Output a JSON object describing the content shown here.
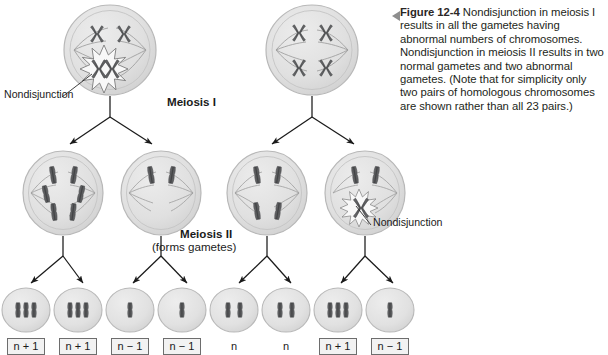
{
  "caption": {
    "marker": "left-triangle",
    "figure_number": "Figure 12-4",
    "text": " Nondisjunction in meiosis I results in all the gametes having abnormal numbers of chromosomes. Nondisjunction in meiosis II results in two normal gametes and two abnormal gametes. (Note that for simplicity only two pairs of homologous chromosomes are shown rather than all 23 pairs.)"
  },
  "labels": {
    "meiosis_1": "Meiosis I",
    "meiosis_2": "Meiosis II",
    "meiosis_2_sub": "(forms gametes)",
    "nondisjunction_1": "Nondisjunction",
    "nondisjunction_2": "Nondisjunction"
  },
  "rows": {
    "parent_cells": [
      {
        "name": "parent-cell-left",
        "cx": 110,
        "cy": 50,
        "chromosomes": 4,
        "nondisjunction": true,
        "note": "meiosis I nondisjunction - burst at lower chromosome pair"
      },
      {
        "name": "parent-cell-right",
        "cx": 312,
        "cy": 50,
        "chromosomes": 4,
        "nondisjunction": false
      }
    ],
    "meiosis1_products": [
      {
        "name": "m1-cell-1",
        "cx": 63,
        "cy": 193,
        "chromosomes": 6,
        "nondisjunction": false
      },
      {
        "name": "m1-cell-2",
        "cx": 161,
        "cy": 193,
        "chromosomes": 2,
        "nondisjunction": false
      },
      {
        "name": "m1-cell-3",
        "cx": 267,
        "cy": 193,
        "chromosomes": 4,
        "nondisjunction": false
      },
      {
        "name": "m1-cell-4",
        "cx": 365,
        "cy": 193,
        "chromosomes": 4,
        "nondisjunction": true,
        "note": "meiosis II nondisjunction - burst at lower chromosome"
      }
    ],
    "gametes": [
      {
        "name": "gamete-1",
        "cx": 26,
        "cy": 310,
        "chromosomes": 3,
        "ploidy": "n + 1",
        "boxed": true
      },
      {
        "name": "gamete-2",
        "cx": 78,
        "cy": 310,
        "chromosomes": 3,
        "ploidy": "n + 1",
        "boxed": true
      },
      {
        "name": "gamete-3",
        "cx": 130,
        "cy": 310,
        "chromosomes": 1,
        "ploidy": "n − 1",
        "boxed": true
      },
      {
        "name": "gamete-4",
        "cx": 182,
        "cy": 310,
        "chromosomes": 1,
        "ploidy": "n − 1",
        "boxed": true
      },
      {
        "name": "gamete-5",
        "cx": 234,
        "cy": 310,
        "chromosomes": 2,
        "ploidy": "n",
        "boxed": false
      },
      {
        "name": "gamete-6",
        "cx": 286,
        "cy": 310,
        "chromosomes": 2,
        "ploidy": "n",
        "boxed": false
      },
      {
        "name": "gamete-7",
        "cx": 338,
        "cy": 310,
        "chromosomes": 3,
        "ploidy": "n + 1",
        "boxed": true
      },
      {
        "name": "gamete-8",
        "cx": 390,
        "cy": 310,
        "chromosomes": 1,
        "ploidy": "n − 1",
        "boxed": true
      }
    ]
  },
  "colors": {
    "cell_fill": "#dedede",
    "cell_fill_light": "#e9e9e9",
    "cell_stroke": "#b3b3b3",
    "chromosome": "#58595b",
    "chromosome_dark": "#4a4b4d",
    "spindle": "#9a9a9a",
    "arrow": "#1a1a1a",
    "burst_fill": "#f7f7f7",
    "burst_stroke": "#6f6f6f",
    "caption_text": "#231f20",
    "box_border": "#6d6d6d",
    "box_fill": "#f2f2f2"
  }
}
